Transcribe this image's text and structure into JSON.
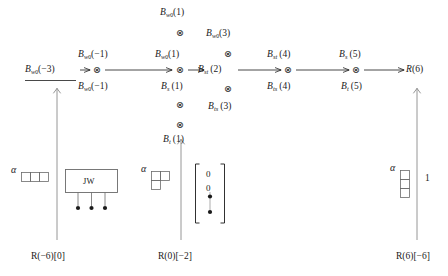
{
  "figure": {
    "type": "commutative-diagram"
  },
  "top_row": [
    {
      "label": "B_w0(1)",
      "base": "B",
      "subscript": "w",
      "subscript_index": "0",
      "arg": "(1)",
      "x": 176,
      "y": 12
    },
    {
      "label": "B_w0(3)",
      "base": "B",
      "subscript": "w",
      "subscript_index": "0",
      "arg": "(3)",
      "x": 224,
      "y": 33
    }
  ],
  "upper_row": [
    {
      "label": "B_w0(-1)",
      "base": "B",
      "subscript": "w",
      "subscript_index": "0",
      "arg": "(−1)",
      "x": 94,
      "y": 54
    },
    {
      "label": "B_w0(1)",
      "base": "B",
      "subscript": "w",
      "subscript_index": "0",
      "arg": "(1)",
      "x": 166,
      "y": 54
    },
    {
      "label": "B_st(4)",
      "base": "B",
      "subscript": "st",
      "subscript_index": "",
      "arg": "(4)",
      "x": 280,
      "y": 54
    },
    {
      "label": "B_s(5)",
      "base": "B",
      "subscript": "s",
      "subscript_index": "",
      "arg": "(5)",
      "x": 348,
      "y": 54
    }
  ],
  "main_row": [
    {
      "label": "B_w0(-3)",
      "base": "B",
      "subscript": "w",
      "subscript_index": "0",
      "arg": "(−3)",
      "x": 27,
      "y": 70,
      "underlined": true
    },
    {
      "label": "B_st(2)",
      "base": "B",
      "subscript": "st",
      "subscript_index": "",
      "arg": "(2)",
      "x": 207,
      "y": 70,
      "underlined": false
    }
  ],
  "lower_row": [
    {
      "label": "B_w0(-1)",
      "base": "B",
      "subscript": "w",
      "subscript_index": "0",
      "arg": "(−1)",
      "x": 94,
      "y": 86
    },
    {
      "label": "B_s(1)",
      "base": "B",
      "subscript": "s",
      "subscript_index": "",
      "arg": "(1)",
      "x": 170,
      "y": 86
    },
    {
      "label": "B_ts(4)",
      "base": "B",
      "subscript": "ts",
      "subscript_index": "",
      "arg": "(4)",
      "x": 280,
      "y": 86
    },
    {
      "label": "B_t(5)",
      "base": "B",
      "subscript": "t",
      "subscript_index": "",
      "arg": "(5)",
      "x": 350,
      "y": 86
    }
  ],
  "bottom_row": [
    {
      "label": "B_ts(3)",
      "base": "B",
      "subscript": "ts",
      "subscript_index": "",
      "arg": "(3)",
      "x": 222,
      "y": 107
    },
    {
      "label": "B_t(1)",
      "base": "B",
      "subscript": "t",
      "subscript_index": "",
      "arg": "(1)",
      "x": 176,
      "y": 126
    }
  ],
  "terminal": {
    "label": "R(6)",
    "base": "R",
    "arg": "(6)",
    "x": 408,
    "y": 70
  },
  "tensor_symbol": "⊗",
  "tensors": [
    {
      "x": 180,
      "y": 33
    },
    {
      "x": 228,
      "y": 54
    },
    {
      "x": 97,
      "y": 70
    },
    {
      "x": 180,
      "y": 70
    },
    {
      "x": 288,
      "y": 70
    },
    {
      "x": 356,
      "y": 70
    },
    {
      "x": 180,
      "y": 89
    },
    {
      "x": 228,
      "y": 89
    },
    {
      "x": 180,
      "y": 110
    }
  ],
  "alphas": [
    {
      "symbol": "α",
      "x": 12,
      "y": 168
    },
    {
      "symbol": "α",
      "x": 142,
      "y": 168
    },
    {
      "symbol": "α",
      "x": 391,
      "y": 166
    }
  ],
  "jw_box": {
    "label": "JW",
    "legs": 3
  },
  "young_diagrams": [
    {
      "name": "row-of-three",
      "shape": "1x3",
      "cells": [
        [
          1,
          1,
          1
        ]
      ]
    },
    {
      "name": "L-shape",
      "shape": "L",
      "cells": [
        [
          1,
          1
        ],
        [
          1,
          0
        ]
      ]
    },
    {
      "name": "column-of-three",
      "shape": "3x1",
      "cells": [
        [
          1
        ],
        [
          1
        ],
        [
          1
        ]
      ]
    }
  ],
  "column_vector": {
    "entries": [
      "0",
      "0",
      "•",
      "•"
    ]
  },
  "right_multiplicity": "1",
  "captions": [
    {
      "text": "R(−6)[0]",
      "x": 31,
      "y": 255
    },
    {
      "text": "R(0)[−2]",
      "x": 158,
      "y": 255
    },
    {
      "text": "R(6)[−6]",
      "x": 398,
      "y": 255
    }
  ],
  "colors": {
    "ink": "#1a1a1a",
    "rule": "#8a8a8a",
    "box_border": "#6b6b6b"
  }
}
